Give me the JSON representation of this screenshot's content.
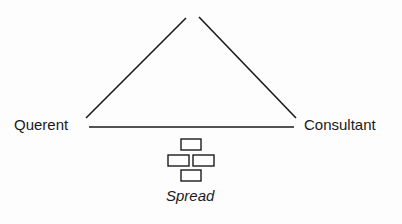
{
  "diagram": {
    "nodes": {
      "left": "Querent",
      "right": "Consultant",
      "bottom": "Spread",
      "top": ""
    },
    "edges": [
      {
        "from": "left",
        "to": "top"
      },
      {
        "from": "top",
        "to": "right"
      },
      {
        "from": "left",
        "to": "right"
      }
    ],
    "spread_icon": "four-card-cross-layout"
  }
}
